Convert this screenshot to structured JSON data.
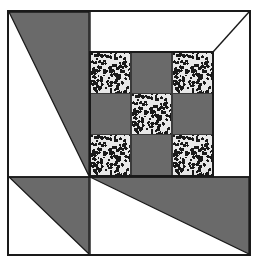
{
  "figure": {
    "width": 261,
    "height": 264,
    "background_color": "#ffffff"
  },
  "colors": {
    "background": "#ffffff",
    "dark_gray": "#6a6a6a",
    "speckle_base": "#e8e8e8",
    "speckle_dot": "#1a1a1a",
    "outline": "#1a1a1a",
    "inner_line": "#3a3a3a"
  },
  "frame": {
    "name": "outer-square-frame",
    "x": 8,
    "y": 11,
    "width": 242,
    "height": 244,
    "stroke_width": 1.6,
    "fill": "#ffffff"
  },
  "nine_patch": {
    "name": "center-nine-patch",
    "x": 90,
    "y": 52,
    "width": 123,
    "height": 124,
    "rows": 3,
    "columns": 3,
    "cell_width": 41,
    "cell_height": 41.3,
    "cells": [
      {
        "row": 0,
        "col": 0,
        "fill": "speckled"
      },
      {
        "row": 0,
        "col": 1,
        "fill": "dark"
      },
      {
        "row": 0,
        "col": 2,
        "fill": "speckled"
      },
      {
        "row": 1,
        "col": 0,
        "fill": "dark"
      },
      {
        "row": 1,
        "col": 1,
        "fill": "speckled"
      },
      {
        "row": 1,
        "col": 2,
        "fill": "dark"
      },
      {
        "row": 2,
        "col": 0,
        "fill": "speckled"
      },
      {
        "row": 2,
        "col": 1,
        "fill": "dark"
      },
      {
        "row": 2,
        "col": 2,
        "fill": "speckled"
      }
    ]
  },
  "triangles": [
    {
      "name": "top-left-dark-triangle",
      "fill": "dark",
      "points": "9,12 89,12 89,176"
    },
    {
      "name": "bottom-left-dark-triangle",
      "fill": "dark",
      "points": "9,177 89,177 89,254"
    },
    {
      "name": "bottom-right-dark-triangle",
      "fill": "dark",
      "points": "90,177 249,177 249,254"
    }
  ],
  "lines": [
    {
      "name": "top-right-diagonal-line",
      "x1": 249,
      "y1": 12,
      "x2": 213,
      "y2": 52,
      "stroke_width": 1.4
    },
    {
      "name": "vertical-divider-line",
      "x1": 90,
      "y1": 12,
      "x2": 90,
      "y2": 177,
      "stroke_width": 1.4
    },
    {
      "name": "horizontal-divider-line",
      "x1": 9,
      "y1": 177,
      "x2": 249,
      "y2": 177,
      "stroke_width": 1.4
    },
    {
      "name": "vertical-bottom-divider-line",
      "x1": 90,
      "y1": 177,
      "x2": 90,
      "y2": 254,
      "stroke_width": 1.4
    }
  ],
  "speckle": {
    "name": "speckle-texture",
    "dot_count": 150,
    "dot_radius_min": 0.9,
    "dot_radius_max": 1.9,
    "tile_size": 41
  }
}
